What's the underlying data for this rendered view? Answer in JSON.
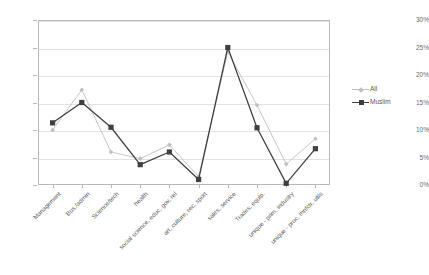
{
  "chart_data": {
    "type": "line",
    "title": "",
    "subtitle": "",
    "xlabel": "",
    "ylabel": "",
    "ylim": [
      0,
      30
    ],
    "ytick_labels": [
      "30%",
      "25%",
      "20%",
      "15%",
      "10%",
      "5%",
      "0%"
    ],
    "ytick_values": [
      30,
      25,
      20,
      15,
      10,
      5,
      0
    ],
    "grid": true,
    "legend_position": "right",
    "categories": [
      "Management",
      "Bus./admin",
      "Science/tech",
      "health",
      "social science, educ, gov, rel",
      "art, culture, rec, sport",
      "sales, service",
      "Trades, equip.",
      "unique - prim. industry",
      "unique - proc, mnfctr, utils"
    ],
    "series": [
      {
        "name": "All",
        "color": "#bfbfbf",
        "marker": "diamond",
        "values": [
          10.0,
          17.3,
          6.0,
          4.8,
          7.3,
          1.5,
          24.2,
          14.5,
          3.8,
          8.4
        ]
      },
      {
        "name": "Muslim",
        "color": "#3f3f3f",
        "marker": "square",
        "values": [
          11.3,
          15.0,
          10.5,
          3.7,
          6.0,
          1.0,
          25.0,
          10.4,
          0.3,
          6.6
        ]
      }
    ]
  },
  "legend": {
    "items": [
      {
        "label": "All"
      },
      {
        "label": "Muslim"
      }
    ]
  }
}
